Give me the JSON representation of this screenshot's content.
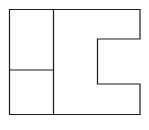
{
  "diagram": {
    "width": 149,
    "height": 130,
    "stroke_color": "#1a1a1a",
    "background": "#ffffff",
    "stroke_width": 1.2,
    "outline_points": "9.5,9.5 140,9.5 140,39 97.5,39 97.5,84 140,84 140,114.5 9.5,114.5",
    "vertical_divider": {
      "x1": 53.5,
      "y1": 9.5,
      "x2": 53.5,
      "y2": 114.5
    },
    "horizontal_divider": {
      "x1": 9.5,
      "y1": 70,
      "x2": 53.5,
      "y2": 70
    }
  }
}
